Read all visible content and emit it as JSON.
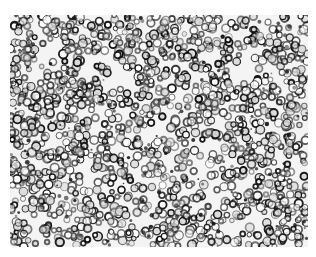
{
  "figure": {
    "type": "micrograph",
    "colors": {
      "background": "#f4f4f4",
      "cell_stroke": "#111111",
      "cell_mid": "#555555"
    }
  },
  "caption": {
    "text": "",
    "truncated": true
  }
}
